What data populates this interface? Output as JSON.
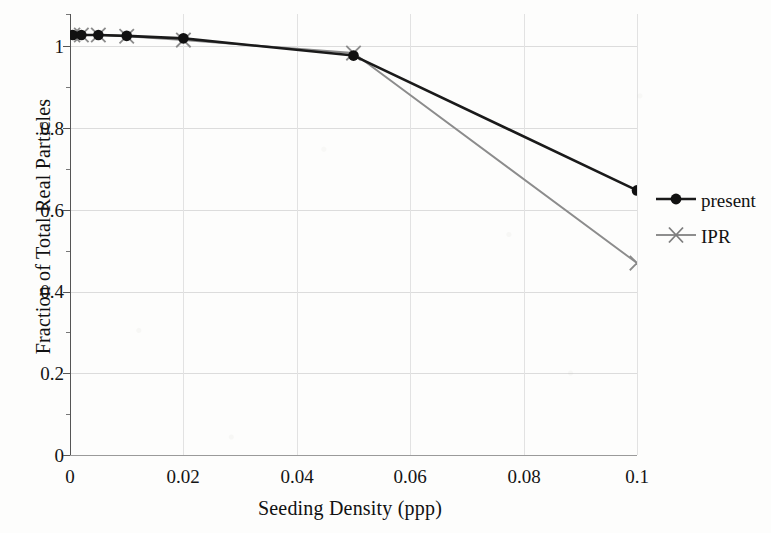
{
  "chart_data": {
    "type": "line",
    "title": "",
    "xlabel": "Seeding Density (ppp)",
    "ylabel": "Fraction of Total Real Particles",
    "xlim": [
      0,
      0.1
    ],
    "ylim": [
      0,
      1.05
    ],
    "grid": true,
    "legend_position": "right-outside",
    "x_ticks": [
      "0",
      "0.02",
      "0.04",
      "0.06",
      "0.08",
      "0.1"
    ],
    "x_tick_values": [
      0,
      0.02,
      0.04,
      0.06,
      0.08,
      0.1
    ],
    "y_ticks": [
      "0",
      "0.2",
      "0.4",
      "0.6",
      "0.8",
      "1"
    ],
    "y_tick_values": [
      0,
      0.2,
      0.4,
      0.6,
      0.8,
      1
    ],
    "series": [
      {
        "name": "present",
        "color": "#1a1a1a",
        "marker": "filled-circle",
        "x": [
          0.0005,
          0.002,
          0.005,
          0.01,
          0.02,
          0.05,
          0.1
        ],
        "values": [
          1.0,
          1.0,
          1.0,
          0.998,
          0.992,
          0.951,
          0.63
        ]
      },
      {
        "name": "IPR",
        "color": "#8c8c8c",
        "marker": "cross-x",
        "x": [
          0.0005,
          0.002,
          0.005,
          0.01,
          0.02,
          0.05,
          0.1
        ],
        "values": [
          1.0,
          1.0,
          1.0,
          0.997,
          0.988,
          0.957,
          0.457
        ]
      }
    ]
  },
  "axes": {
    "x_title": "Seeding Density (ppp)",
    "y_title": "Fraction of Total Real Particles",
    "x_tick_labels": [
      "0",
      "0.02",
      "0.04",
      "0.06",
      "0.08",
      "0.1"
    ],
    "y_tick_labels": [
      "1",
      "0.8",
      "0.6",
      "0.4",
      "0.2",
      "0"
    ]
  },
  "legend": {
    "entries": [
      {
        "label": "present",
        "color": "#1a1a1a",
        "marker": "filled-circle"
      },
      {
        "label": "IPR",
        "color": "#8c8c8c",
        "marker": "cross-x"
      }
    ]
  },
  "colors": {
    "present": "#1a1a1a",
    "ipr": "#8c8c8c",
    "grid": "#dcdcdc",
    "axis": "#555555",
    "background": "#fdfdfc",
    "text": "#141414"
  }
}
